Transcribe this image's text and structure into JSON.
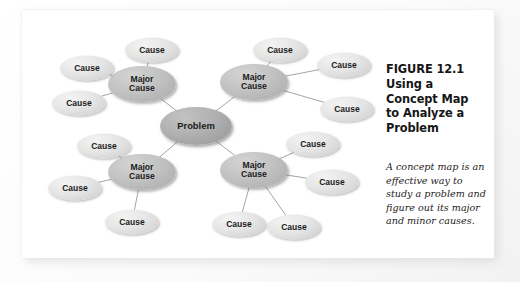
{
  "figure": {
    "title_lines": [
      "FIGURE 12.1",
      "Using a",
      "Concept Map",
      "to Analyze a",
      "Problem"
    ],
    "title_text": "FIGURE 12.1 Using a Concept Map to Analyze a Problem",
    "caption": "A concept map is an effective way to study a problem and figure out its major and minor causes."
  },
  "colors": {
    "page_background": "#ffffff",
    "card_background": "#ffffff",
    "problem_node": "#a8a8a8",
    "major_node": "#bcbcbc",
    "cause_node": "#e3e3e3",
    "connector": "#9a9a9a",
    "text": "#161616"
  },
  "chart_data": {
    "type": "diagram",
    "diagram_kind": "concept-map",
    "center": {
      "id": "problem",
      "label": "Problem",
      "x": 174,
      "y": 116,
      "level": "problem"
    },
    "nodes": [
      {
        "id": "problem",
        "label": "Problem",
        "level": "problem",
        "x": 174,
        "y": 116
      },
      {
        "id": "major-tl",
        "label": "Major\nCause",
        "level": "major",
        "x": 120,
        "y": 74
      },
      {
        "id": "major-tr",
        "label": "Major\nCause",
        "level": "major",
        "x": 232,
        "y": 72
      },
      {
        "id": "major-bl",
        "label": "Major\nCause",
        "level": "major",
        "x": 120,
        "y": 162
      },
      {
        "id": "major-br",
        "label": "Major\nCause",
        "level": "major",
        "x": 232,
        "y": 160
      },
      {
        "id": "cause-tl-1",
        "label": "Cause",
        "level": "cause",
        "x": 130,
        "y": 40
      },
      {
        "id": "cause-tl-2",
        "label": "Cause",
        "level": "cause",
        "x": 65,
        "y": 58
      },
      {
        "id": "cause-tl-3",
        "label": "Cause",
        "level": "cause",
        "x": 57,
        "y": 93
      },
      {
        "id": "cause-tr-1",
        "label": "Cause",
        "level": "cause",
        "x": 258,
        "y": 40
      },
      {
        "id": "cause-tr-2",
        "label": "Cause",
        "level": "cause",
        "x": 322,
        "y": 55
      },
      {
        "id": "cause-tr-3",
        "label": "Cause",
        "level": "cause",
        "x": 325,
        "y": 99
      },
      {
        "id": "cause-bl-1",
        "label": "Cause",
        "level": "cause",
        "x": 82,
        "y": 136
      },
      {
        "id": "cause-bl-2",
        "label": "Cause",
        "level": "cause",
        "x": 53,
        "y": 178
      },
      {
        "id": "cause-bl-3",
        "label": "Cause",
        "level": "cause",
        "x": 110,
        "y": 212
      },
      {
        "id": "cause-br-1",
        "label": "Cause",
        "level": "cause",
        "x": 291,
        "y": 134
      },
      {
        "id": "cause-br-2",
        "label": "Cause",
        "level": "cause",
        "x": 310,
        "y": 172
      },
      {
        "id": "cause-br-3",
        "label": "Cause",
        "level": "cause",
        "x": 217,
        "y": 214
      },
      {
        "id": "cause-br-4",
        "label": "Cause",
        "level": "cause",
        "x": 272,
        "y": 217
      }
    ],
    "edges": [
      {
        "from": "problem",
        "to": "major-tl"
      },
      {
        "from": "problem",
        "to": "major-tr"
      },
      {
        "from": "problem",
        "to": "major-bl"
      },
      {
        "from": "problem",
        "to": "major-br"
      },
      {
        "from": "major-tl",
        "to": "cause-tl-1"
      },
      {
        "from": "major-tl",
        "to": "cause-tl-2"
      },
      {
        "from": "major-tl",
        "to": "cause-tl-3"
      },
      {
        "from": "major-tr",
        "to": "cause-tr-1"
      },
      {
        "from": "major-tr",
        "to": "cause-tr-2"
      },
      {
        "from": "major-tr",
        "to": "cause-tr-3"
      },
      {
        "from": "major-bl",
        "to": "cause-bl-1"
      },
      {
        "from": "major-bl",
        "to": "cause-bl-2"
      },
      {
        "from": "major-bl",
        "to": "cause-bl-3"
      },
      {
        "from": "major-br",
        "to": "cause-br-1"
      },
      {
        "from": "major-br",
        "to": "cause-br-2"
      },
      {
        "from": "major-br",
        "to": "cause-br-3"
      },
      {
        "from": "major-br",
        "to": "cause-br-4"
      }
    ],
    "counts": {
      "problem": 1,
      "major_causes": 4,
      "causes": 13
    },
    "legend": [],
    "xlabel": "",
    "ylabel": ""
  }
}
